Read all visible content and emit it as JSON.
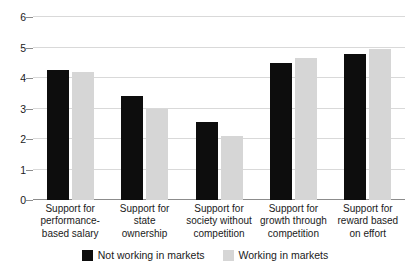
{
  "chart_data": {
    "type": "bar",
    "title": "",
    "subtitle": "",
    "xlabel": "",
    "ylabel": "",
    "ylim": [
      0,
      6
    ],
    "yticks": [
      0,
      1,
      2,
      3,
      4,
      5,
      6
    ],
    "grid": true,
    "legend_position": "bottom",
    "categories": [
      "Support for performance-based salary",
      "Support for state ownership",
      "Support for society without competition",
      "Support for growth through competition",
      "Support for reward based on effort"
    ],
    "category_lines": [
      [
        "Support for",
        "performance-",
        "based salary"
      ],
      [
        "Support for state",
        "ownership"
      ],
      [
        "Support for",
        "society without",
        "competition"
      ],
      [
        "Support for",
        "growth through",
        "competition"
      ],
      [
        "Support for",
        "reward based",
        "on effort"
      ]
    ],
    "series": [
      {
        "name": "Not working in markets",
        "color": "#0d0d0d",
        "values": [
          4.25,
          3.4,
          2.55,
          4.5,
          4.8
        ]
      },
      {
        "name": "Working in markets",
        "color": "#d6d6d6",
        "values": [
          4.2,
          3.0,
          2.1,
          4.65,
          4.95
        ]
      }
    ]
  },
  "axis": {
    "tick_color": "#8c8c8c",
    "grid_color": "#d9d9d9"
  }
}
